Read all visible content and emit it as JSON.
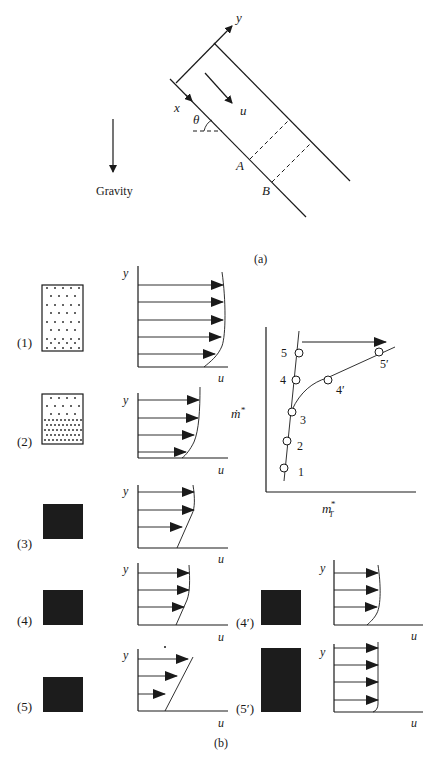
{
  "panel_a": {
    "caption": "(a)",
    "axis_x_label": "x",
    "axis_y_label": "y",
    "velocity_label": "u",
    "angle_label": "θ",
    "point_a_label": "A",
    "point_b_label": "B",
    "gravity_label": "Gravity"
  },
  "panel_b": {
    "caption": "(b)",
    "profiles": [
      {
        "label": "(1)",
        "y_label": "y",
        "u_label": "u",
        "state": "dilute-uniform"
      },
      {
        "label": "(2)",
        "y_label": "y",
        "u_label": "u",
        "state": "dense-bottom"
      },
      {
        "label": "(3)",
        "y_label": "y",
        "u_label": "u",
        "state": "solid"
      },
      {
        "label": "(4)",
        "y_label": "y",
        "u_label": "u",
        "state": "solid"
      },
      {
        "label": "(5)",
        "y_label": "y",
        "u_label": "u",
        "state": "solid-linear"
      },
      {
        "label": "(4′)",
        "y_label": "y",
        "u_label": "u",
        "state": "solid"
      },
      {
        "label": "(5′)",
        "y_label": "y",
        "u_label": "u",
        "state": "solid-tall"
      }
    ],
    "regime_plot": {
      "x_label": "m",
      "x_label_sup": "*",
      "x_label_sub": "T",
      "y_label": "ṁ",
      "y_label_sup": "*",
      "points": [
        "1",
        "2",
        "3",
        "4",
        "5",
        "4′",
        "5′"
      ]
    }
  }
}
